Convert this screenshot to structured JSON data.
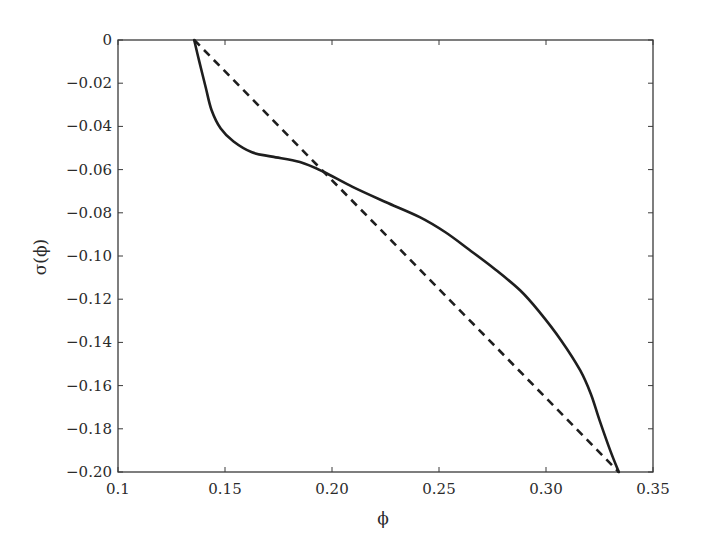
{
  "chart_data": {
    "type": "line",
    "title": "",
    "xlabel": "ϕ",
    "ylabel": "σ(ϕ)",
    "xlim": [
      0.1,
      0.35
    ],
    "ylim": [
      -0.2,
      0
    ],
    "grid": false,
    "legend": null,
    "x_ticks": [
      {
        "value": 0.1,
        "label": "0.1"
      },
      {
        "value": 0.15,
        "label": "0.15"
      },
      {
        "value": 0.2,
        "label": "0.20"
      },
      {
        "value": 0.25,
        "label": "0.25"
      },
      {
        "value": 0.3,
        "label": "0.30"
      },
      {
        "value": 0.35,
        "label": "0.35"
      }
    ],
    "y_ticks": [
      {
        "value": 0,
        "label": "0"
      },
      {
        "value": -0.02,
        "label": "−0.02"
      },
      {
        "value": -0.04,
        "label": "−0.04"
      },
      {
        "value": -0.06,
        "label": "−0.06"
      },
      {
        "value": -0.08,
        "label": "−0.08"
      },
      {
        "value": -0.1,
        "label": "−0.10"
      },
      {
        "value": -0.12,
        "label": "−0.12"
      },
      {
        "value": -0.14,
        "label": "−0.14"
      },
      {
        "value": -0.16,
        "label": "−0.16"
      },
      {
        "value": -0.18,
        "label": "−0.18"
      },
      {
        "value": -0.2,
        "label": "−0.20"
      }
    ],
    "series": [
      {
        "name": "sigma_curve",
        "style": "solid",
        "color": "#1e1e1e",
        "x": [
          0.1356,
          0.138,
          0.141,
          0.1437,
          0.148,
          0.154,
          0.1626,
          0.172,
          0.185,
          0.196,
          0.2096,
          0.225,
          0.241,
          0.253,
          0.264,
          0.276,
          0.288,
          0.297,
          0.307,
          0.316,
          0.321,
          0.325,
          0.33,
          0.334
        ],
        "y": [
          0.0,
          -0.01,
          -0.022,
          -0.0324,
          -0.041,
          -0.047,
          -0.052,
          -0.054,
          -0.0565,
          -0.061,
          -0.068,
          -0.075,
          -0.082,
          -0.089,
          -0.097,
          -0.106,
          -0.116,
          -0.126,
          -0.139,
          -0.153,
          -0.164,
          -0.176,
          -0.19,
          -0.2
        ]
      },
      {
        "name": "linear_reference",
        "style": "dashed",
        "color": "#1e1e1e",
        "x": [
          0.1356,
          0.334
        ],
        "y": [
          0.0,
          -0.2
        ]
      }
    ]
  },
  "plot_area": {
    "left": 118,
    "top": 40,
    "right": 653,
    "bottom": 472
  }
}
